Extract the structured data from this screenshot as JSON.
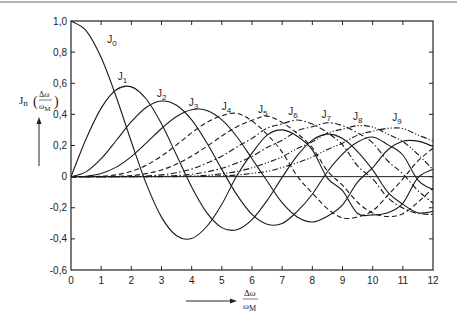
{
  "chart_data": {
    "type": "line",
    "title": "",
    "xlabel": {
      "numerator": "Δω",
      "denominator": "ωM",
      "denominator_main": "ω",
      "denominator_sub": "M"
    },
    "ylabel": {
      "prefix": "J",
      "sub": "n",
      "numerator": "Δω",
      "denominator_main": "ω",
      "denominator_sub": "M"
    },
    "xlim": [
      0,
      12
    ],
    "ylim": [
      -0.6,
      1.0
    ],
    "x_ticks": [
      0,
      1,
      2,
      3,
      4,
      5,
      6,
      7,
      8,
      9,
      10,
      11,
      12
    ],
    "x_tick_labels": [
      "0",
      "1",
      "2",
      "3",
      "4",
      "5",
      "6",
      "7",
      "8",
      "9",
      "10",
      "11",
      "12"
    ],
    "y_ticks": [
      1.0,
      0.8,
      0.6,
      0.4,
      0.2,
      0,
      -0.2,
      -0.4,
      -0.6
    ],
    "y_tick_labels": [
      "1,0",
      "0,8",
      "0,6",
      "0,4",
      "0,2",
      "0",
      "-0,2",
      "-0,4",
      "-0,6"
    ],
    "grid": false,
    "zero_line": true,
    "x": [
      0,
      0.5,
      1,
      1.5,
      2,
      2.5,
      3,
      3.5,
      4,
      4.5,
      5,
      5.5,
      6,
      6.5,
      7,
      7.5,
      8,
      8.5,
      9,
      9.5,
      10,
      10.5,
      11,
      11.5,
      12
    ],
    "series": [
      {
        "name": "J0",
        "label_main": "J",
        "label_sub": "0",
        "style": "solid",
        "label_at": [
          1.2,
          0.86
        ],
        "values": [
          1,
          0.9385,
          0.7652,
          0.5118,
          0.2239,
          -0.0484,
          -0.2601,
          -0.3801,
          -0.3971,
          -0.3205,
          -0.1776,
          0.0068,
          0.1506,
          0.2663,
          0.3001,
          0.2595,
          0.1717,
          -0.0094,
          -0.0903,
          -0.2366,
          -0.2459,
          -0.232,
          -0.1712,
          -0.0068,
          0.0477
        ]
      },
      {
        "name": "J1",
        "label_main": "J",
        "label_sub": "1",
        "style": "solid",
        "label_at": [
          1.55,
          0.62
        ],
        "values": [
          0,
          0.2423,
          0.4401,
          0.5579,
          0.5767,
          0.4971,
          0.3391,
          0.1374,
          -0.066,
          -0.2311,
          -0.3276,
          -0.3414,
          -0.2767,
          -0.1538,
          -0.0047,
          0.1352,
          0.2346,
          0.2731,
          0.2453,
          0.1613,
          0.0435,
          -0.0994,
          -0.1768,
          -0.2323,
          -0.2234
        ]
      },
      {
        "name": "J2",
        "label_main": "J",
        "label_sub": "2",
        "style": "solid",
        "label_at": [
          2.85,
          0.51
        ],
        "values": [
          0,
          0.0306,
          0.1149,
          0.2321,
          0.3528,
          0.4461,
          0.4861,
          0.4586,
          0.3641,
          0.2178,
          0.0466,
          -0.1173,
          -0.2429,
          -0.3057,
          -0.3014,
          -0.2233,
          -0.113,
          0.0316,
          0.1448,
          0.2223,
          0.2546,
          0.2055,
          0.139,
          -0.0223,
          -0.0849
        ]
      },
      {
        "name": "J3",
        "label_main": "J",
        "label_sub": "3",
        "style": "solid",
        "label_at": [
          3.9,
          0.455
        ],
        "values": [
          0,
          0.0026,
          0.0196,
          0.061,
          0.1289,
          0.2166,
          0.3091,
          0.3868,
          0.4302,
          0.4247,
          0.3648,
          0.2561,
          0.1148,
          -0.0283,
          -0.1676,
          -0.2596,
          -0.2911,
          -0.2542,
          -0.1809,
          -0.0357,
          0.0584,
          0.1711,
          0.2273,
          0.2283,
          0.1951
        ]
      },
      {
        "name": "J4",
        "label_main": "J",
        "label_sub": "4",
        "style": "dashed",
        "label_at": [
          5.0,
          0.43
        ],
        "values": [
          0,
          0.0002,
          0.0025,
          0.0118,
          0.034,
          0.0738,
          0.132,
          0.2044,
          0.2811,
          0.3484,
          0.3912,
          0.4066,
          0.3576,
          0.2714,
          0.1578,
          0.0029,
          -0.1054,
          -0.2057,
          -0.2655,
          -0.2591,
          -0.2196,
          -0.1204,
          -0.015,
          0.1005,
          0.1825
        ]
      },
      {
        "name": "J5",
        "label_main": "J",
        "label_sub": "5",
        "style": "dashed",
        "label_at": [
          6.2,
          0.41
        ],
        "values": [
          0,
          0,
          0.0002,
          0.0018,
          0.007,
          0.0195,
          0.043,
          0.0804,
          0.1321,
          0.1941,
          0.2611,
          0.3209,
          0.3621,
          0.3889,
          0.3479,
          0.2774,
          0.1858,
          0.0366,
          -0.055,
          -0.1648,
          -0.2341,
          -0.2565,
          -0.2383,
          -0.1652,
          -0.0735
        ]
      },
      {
        "name": "J6",
        "label_main": "J",
        "label_sub": "6",
        "style": "dashdot",
        "label_at": [
          7.2,
          0.395
        ],
        "values": [
          0,
          0,
          0,
          0.0002,
          0.0012,
          0.0042,
          0.0114,
          0.0254,
          0.0491,
          0.0868,
          0.131,
          0.1906,
          0.2458,
          0.3108,
          0.3392,
          0.3637,
          0.3376,
          0.283,
          0.2043,
          0.0692,
          -0.0145,
          -0.1347,
          -0.2016,
          -0.2363,
          -0.2437
        ]
      },
      {
        "name": "J7",
        "label_main": "J",
        "label_sub": "7",
        "style": "dashdot",
        "label_at": [
          8.3,
          0.375
        ],
        "values": [
          0,
          0,
          0,
          0,
          0.0002,
          0.0008,
          0.0025,
          0.0067,
          0.0152,
          0.0305,
          0.0534,
          0.0877,
          0.1296,
          0.1873,
          0.2336,
          0.294,
          0.3206,
          0.346,
          0.3275,
          0.2813,
          0.2167,
          0.1006,
          0.0184,
          -0.0901,
          -0.1703
        ]
      },
      {
        "name": "J8",
        "label_main": "J",
        "label_sub": "8",
        "style": "dashdotdot",
        "label_at": [
          9.35,
          0.365
        ],
        "values": [
          0,
          0,
          0,
          0,
          0,
          0.0001,
          0.0004,
          0.0015,
          0.004,
          0.0089,
          0.0184,
          0.0325,
          0.0565,
          0.0892,
          0.128,
          0.1806,
          0.2235,
          0.2793,
          0.3051,
          0.3275,
          0.3179,
          0.2728,
          0.225,
          0.143,
          0.0451
        ]
      },
      {
        "name": "J9",
        "label_main": "J",
        "label_sub": "9",
        "style": "dashdotdot",
        "label_at": [
          10.65,
          0.355
        ],
        "values": [
          0,
          0,
          0,
          0,
          0,
          0,
          0.0001,
          0.0003,
          0.0009,
          0.0022,
          0.0055,
          0.0101,
          0.0212,
          0.0336,
          0.0589,
          0.0887,
          0.1263,
          0.1743,
          0.2149,
          0.2667,
          0.2919,
          0.31,
          0.3089,
          0.2677,
          0.2304
        ]
      }
    ]
  }
}
